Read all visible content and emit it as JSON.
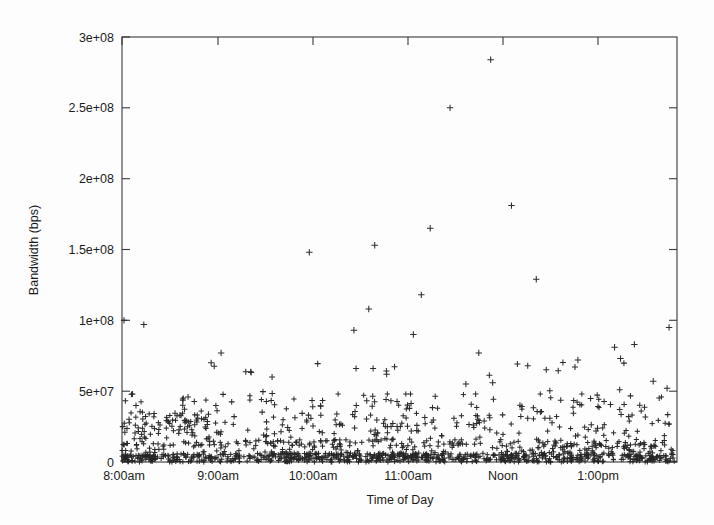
{
  "chart_data": {
    "type": "scatter",
    "title": "",
    "xlabel": "Time of Day",
    "ylabel": "Bandwidth (bps)",
    "marker": "plus",
    "grid": false,
    "legend": null,
    "xlim": [
      8.0,
      13.6
    ],
    "ylim": [
      0,
      300000000
    ],
    "x_tick_labels": [
      "8:00am",
      "9:00am",
      "10:00am",
      "11:00am",
      "Noon",
      "1:00pm"
    ],
    "x_tick_values": [
      8,
      9,
      10,
      11,
      12,
      13
    ],
    "y_tick_labels": [
      "0",
      "5e+07",
      "1e+08",
      "1.5e+08",
      "2e+08",
      "2.5e+08",
      "3e+08"
    ],
    "y_tick_values": [
      0,
      50000000,
      100000000,
      150000000,
      200000000,
      250000000,
      300000000
    ],
    "notable_outliers": [
      {
        "x": 11.72,
        "y": 284000000
      },
      {
        "x": 11.31,
        "y": 250000000
      },
      {
        "x": 11.93,
        "y": 181000000
      },
      {
        "x": 11.11,
        "y": 165000000
      },
      {
        "x": 10.55,
        "y": 153000000
      },
      {
        "x": 9.89,
        "y": 148000000
      },
      {
        "x": 12.18,
        "y": 129000000
      },
      {
        "x": 11.02,
        "y": 118000000
      },
      {
        "x": 10.49,
        "y": 108000000
      },
      {
        "x": 8.02,
        "y": 100000000
      },
      {
        "x": 8.22,
        "y": 97000000
      },
      {
        "x": 13.52,
        "y": 95000000
      },
      {
        "x": 10.34,
        "y": 93000000
      },
      {
        "x": 10.94,
        "y": 90000000
      },
      {
        "x": 13.17,
        "y": 83000000
      },
      {
        "x": 12.97,
        "y": 81000000
      },
      {
        "x": 11.6,
        "y": 77000000
      },
      {
        "x": 9.0,
        "y": 77000000
      },
      {
        "x": 13.03,
        "y": 73000000
      },
      {
        "x": 12.6,
        "y": 72000000
      },
      {
        "x": 8.9,
        "y": 70000000
      },
      {
        "x": 10.67,
        "y": 62000000
      },
      {
        "x": 13.36,
        "y": 57000000
      },
      {
        "x": 11.74,
        "y": 56000000
      },
      {
        "x": 11.47,
        "y": 55000000
      },
      {
        "x": 13.5,
        "y": 52000000
      }
    ],
    "series": [
      {
        "name": "bandwidth samples",
        "description": "Dense band of samples between 0 and ~4.5e7 bps spanning 8:00am to ~1:35pm, with sparse high-value outliers."
      }
    ]
  },
  "axes": {
    "x_title": "Time of Day",
    "y_title": "Bandwidth (bps)"
  }
}
